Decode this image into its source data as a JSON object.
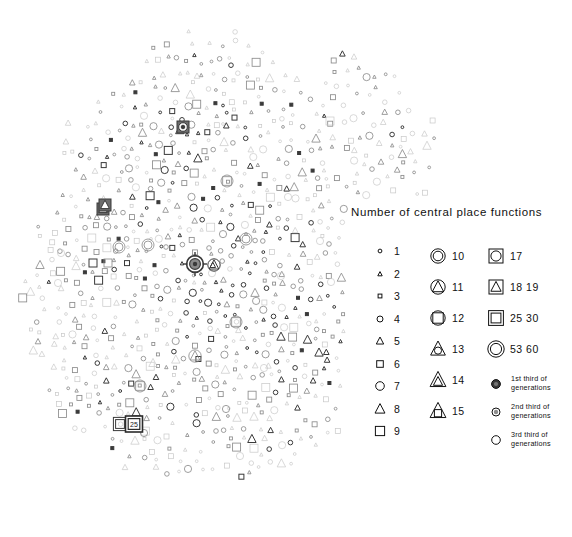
{
  "legend": {
    "title": "Number of central place functions",
    "columns": [
      {
        "name": "column-1",
        "entries": [
          {
            "label": "1",
            "symbol": "circle-xs"
          },
          {
            "label": "2",
            "symbol": "triangle-xs"
          },
          {
            "label": "3",
            "symbol": "square-xs"
          },
          {
            "label": "4",
            "symbol": "circle-s"
          },
          {
            "label": "5",
            "symbol": "triangle-s"
          },
          {
            "label": "6",
            "symbol": "square-s"
          },
          {
            "label": "7",
            "symbol": "circle-m"
          },
          {
            "label": "8",
            "symbol": "triangle-m"
          },
          {
            "label": "9",
            "symbol": "square-m"
          }
        ]
      },
      {
        "name": "column-2",
        "entries": [
          {
            "label": "10",
            "symbol": "circle-in-circle"
          },
          {
            "label": "11",
            "symbol": "triangle-in-circle"
          },
          {
            "label": "12",
            "symbol": "square-in-circle"
          },
          {
            "label": "13",
            "symbol": "circle-in-triangle"
          },
          {
            "label": "14",
            "symbol": "triangle-in-triangle"
          },
          {
            "label": "15",
            "symbol": "square-in-triangle"
          }
        ]
      },
      {
        "name": "column-3",
        "entries": [
          {
            "label": "17",
            "symbol": "circle-in-square"
          },
          {
            "label": "18  19",
            "symbol": "triangle-in-square"
          },
          {
            "label": "25  30",
            "symbol": "square-in-square"
          },
          {
            "label": "53  60",
            "symbol": "circle-in-circle-large"
          }
        ]
      }
    ],
    "generations": [
      {
        "label": "1st third of\ngenerations",
        "symbol": "filled-dark-circle"
      },
      {
        "label": "2nd third of\ngenerations",
        "symbol": "filled-mid-circle"
      },
      {
        "label": "3rd third of\ngenerations",
        "symbol": "open-circle"
      }
    ]
  },
  "map": {
    "label_25": "25",
    "colors": {
      "gen1": "#3a3a3a",
      "gen2": "#8c8c8c",
      "gen3": "#c8c8c8",
      "background": "#ffffff"
    }
  },
  "chart_data": {
    "type": "scatter",
    "title": "Number of central place functions",
    "xlabel": "",
    "ylabel": "",
    "xlim": [
      0,
      572
    ],
    "ylim": [
      0,
      537
    ],
    "grid": false,
    "legend_position": "right-middle",
    "encoding": {
      "shape": "number of central place functions (1-60)",
      "fill": "generation third (1st darkest, 3rd open)"
    },
    "series": [
      {
        "name": "1st third of generations",
        "color": "#3a3a3a",
        "marker": "filled"
      },
      {
        "name": "2nd third of generations",
        "color": "#8c8c8c",
        "marker": "half-filled"
      },
      {
        "name": "3rd third of generations",
        "color": "#c8c8c8",
        "marker": "open"
      }
    ],
    "points": [
      [
        183,
        127,
        17,
        1
      ],
      [
        195,
        264,
        53,
        1
      ],
      [
        223,
        124,
        1,
        3
      ],
      [
        120,
        424,
        25,
        1
      ],
      [
        227,
        181,
        12,
        2
      ],
      [
        103,
        209,
        18,
        1
      ],
      [
        246,
        239,
        10,
        2
      ],
      [
        214,
        265,
        11,
        1
      ],
      [
        195,
        356,
        11,
        2
      ],
      [
        236,
        322,
        12,
        2
      ],
      [
        226,
        409,
        7,
        2
      ],
      [
        144,
        433,
        7,
        2
      ],
      [
        281,
        276,
        7,
        3
      ],
      [
        320,
        241,
        7,
        3
      ],
      [
        331,
        282,
        7,
        3
      ],
      [
        148,
        245,
        10,
        2
      ],
      [
        108,
        263,
        9,
        2
      ],
      [
        330,
        121,
        9,
        3
      ],
      [
        197,
        76,
        5,
        3
      ],
      [
        119,
        247,
        10,
        2
      ],
      [
        153,
        363,
        8,
        3
      ],
      [
        105,
        205,
        18,
        1
      ],
      [
        58,
        283,
        7,
        3
      ],
      [
        61,
        253,
        7,
        3
      ],
      [
        264,
        368,
        7,
        3
      ],
      [
        140,
        386,
        12,
        2
      ],
      [
        288,
        197,
        7,
        3
      ],
      [
        240,
        456,
        7,
        3
      ],
      [
        95,
        171,
        5,
        3
      ],
      [
        166,
        247,
        4,
        2
      ],
      [
        209,
        248,
        4,
        2
      ]
    ],
    "note": "Dense dot-distribution map: ~900 graduated point symbols across the field; shape/size encodes function count, tone encodes generation third."
  }
}
